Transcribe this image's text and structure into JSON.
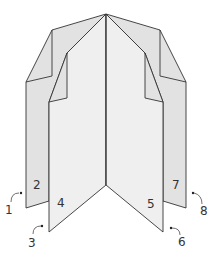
{
  "diagram": {
    "colors": {
      "outer_panel": "#e2e2e2",
      "inner_panel": "#ececec",
      "front_panel": "#f0f0f0",
      "stroke": "#333333",
      "background": "#ffffff"
    },
    "panel_labels": [
      {
        "id": "p2",
        "text": "2"
      },
      {
        "id": "p4",
        "text": "4"
      },
      {
        "id": "p5",
        "text": "5"
      },
      {
        "id": "p7",
        "text": "7"
      }
    ],
    "edge_labels": [
      {
        "id": "e1",
        "text": "1"
      },
      {
        "id": "e3",
        "text": "3"
      },
      {
        "id": "e6",
        "text": "6"
      },
      {
        "id": "e8",
        "text": "8"
      }
    ]
  }
}
